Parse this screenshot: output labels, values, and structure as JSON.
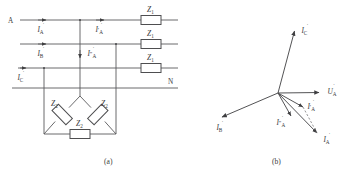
{
  "figure": {
    "panel_a": {
      "caption": "(a)",
      "terminal_left_label": "A",
      "terminal_right_label": "N",
      "line_currents": [
        {
          "name": "I_A",
          "symbol": "I",
          "sub": "A",
          "prime": ""
        },
        {
          "name": "I_B",
          "symbol": "I",
          "sub": "B",
          "prime": ""
        },
        {
          "name": "I_C",
          "symbol": "I",
          "sub": "C",
          "prime": ""
        }
      ],
      "branch_currents": [
        {
          "name": "I_A_prime",
          "symbol": "I",
          "sub": "A",
          "prime": "′"
        },
        {
          "name": "I_A_doubleprime",
          "symbol": "I",
          "sub": "A",
          "prime": "″"
        }
      ],
      "series_impedances": [
        {
          "name": "Z1-phase-a",
          "label": "Z",
          "sub": "1"
        },
        {
          "name": "Z1-phase-b",
          "label": "Z",
          "sub": "1"
        },
        {
          "name": "Z1-phase-c",
          "label": "Z",
          "sub": "1"
        }
      ],
      "delta_impedances": [
        {
          "name": "Z2-left",
          "label": "Z",
          "sub": "2"
        },
        {
          "name": "Z2-right",
          "label": "Z",
          "sub": "2"
        },
        {
          "name": "Z2-bottom",
          "label": "Z",
          "sub": "2"
        }
      ]
    },
    "panel_b": {
      "caption": "(b)",
      "phasors": [
        {
          "name": "U_A",
          "symbol": "U",
          "sub": "A",
          "prime": "",
          "dotted": true
        },
        {
          "name": "I_C",
          "symbol": "I",
          "sub": "C",
          "prime": "",
          "dotted": true
        },
        {
          "name": "I_B",
          "symbol": "I",
          "sub": "B",
          "prime": "",
          "dotted": true
        },
        {
          "name": "I_A",
          "symbol": "I",
          "sub": "A",
          "prime": "",
          "dotted": true
        },
        {
          "name": "I_A_prime",
          "symbol": "I",
          "sub": "A",
          "prime": "′",
          "dotted": true
        },
        {
          "name": "I_A_doubleprime",
          "symbol": "I",
          "sub": "A",
          "prime": "″",
          "dotted": true
        }
      ]
    },
    "colors": {
      "wire": "#59595b",
      "text": "#3a3a3c",
      "background": "#ffffff"
    }
  }
}
